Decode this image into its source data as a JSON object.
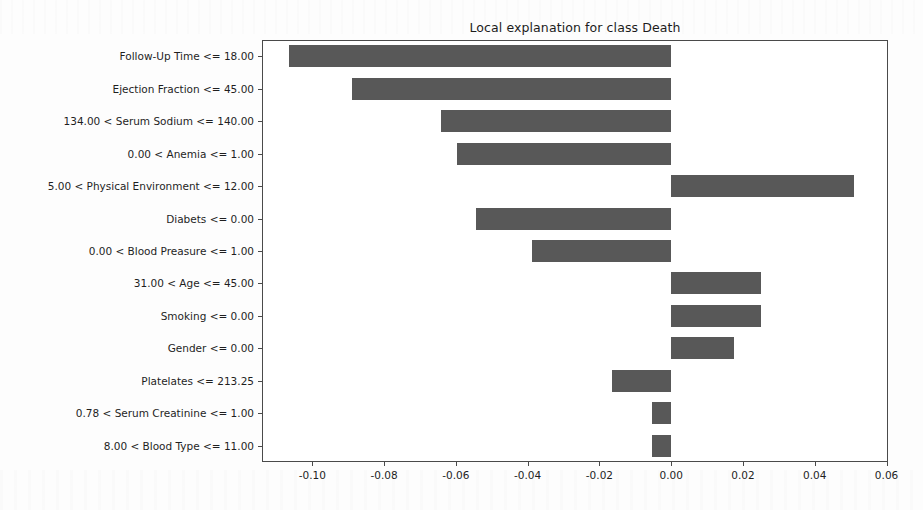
{
  "chart_data": {
    "type": "bar",
    "orientation": "horizontal",
    "title": "Local explanation for class Death",
    "xlabel": "",
    "ylabel": "",
    "grid": false,
    "legend": null,
    "xlim": [
      -0.114,
      0.0604
    ],
    "xticks": [
      -0.1,
      -0.08,
      -0.06,
      -0.04,
      -0.02,
      0.0,
      0.02,
      0.04,
      0.06
    ],
    "xtick_labels": [
      "-0.10",
      "-0.08",
      "-0.06",
      "-0.04",
      "-0.02",
      "0.00",
      "0.02",
      "0.04",
      "0.06"
    ],
    "bar_color": "#585858",
    "categories": [
      "Follow-Up Time <= 18.00",
      "Ejection Fraction <= 45.00",
      "134.00 < Serum Sodium <= 140.00",
      "0.00 < Anemia <= 1.00",
      "5.00 < Physical Environment <= 12.00",
      "Diabets <= 0.00",
      "0.00 < Blood Preasure <= 1.00",
      "31.00 < Age <= 45.00",
      "Smoking <= 0.00",
      "Gender <= 0.00",
      "Platelates <= 213.25",
      "0.78 < Serum Creatinine <= 1.00",
      "8.00 < Blood Type <= 11.00"
    ],
    "values": [
      -0.1066,
      -0.0888,
      -0.064,
      -0.0598,
      0.0509,
      -0.0543,
      -0.0389,
      0.025,
      0.025,
      0.0175,
      -0.0164,
      -0.0053,
      -0.0053
    ]
  }
}
